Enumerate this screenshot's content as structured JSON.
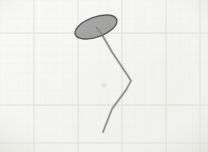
{
  "image": {
    "kind": "scanned-sketch",
    "width": 208,
    "height": 152,
    "title": "Hand sketch on graph paper",
    "description": "Tilted gray filled ellipse with a thin zigzag stem descending below it",
    "background_color": "#f6f6f4",
    "paper_tint_color": "#f2f2ee"
  },
  "grid": {
    "name": "graph-paper-grid",
    "minor_spacing_px": 9,
    "minor_color": "#ecebe6",
    "major_color": "#dcdcd6",
    "major_vertical_x": [
      34,
      78,
      122,
      166,
      200
    ],
    "major_horizontal_y": [
      33,
      105,
      143
    ],
    "minor_opacity": 0.55
  },
  "shapes": {
    "ellipse": {
      "name": "ellipse-cap",
      "center_x": 96,
      "center_y": 27,
      "radius_x": 22,
      "radius_y": 10,
      "rotation_deg": -20,
      "fill_color": "#9b9b9b",
      "stroke_color": "#5a5a5a",
      "stroke_width": 1.4,
      "fill_opacity": 0.92
    },
    "stem": {
      "name": "stem-polyline",
      "points": "101,33 112,52 128,76 131,81 126,90 112,109 103,132",
      "stroke_color": "#7e7e7e",
      "stroke_width": 1.5,
      "stroke_opacity": 0.85
    },
    "stem_highlight": {
      "name": "stem-highlight",
      "points": "101,33 112,52 128,76 131,81 126,90 112,109 103,132",
      "stroke_color": "#b5b5b5",
      "stroke_width": 3,
      "stroke_opacity": 0.35
    },
    "cap_radial_line": {
      "name": "ellipse-radial-crease",
      "x1": 96,
      "y1": 27,
      "x2": 101,
      "y2": 33,
      "stroke_color": "#6e6e6e",
      "stroke_width": 1
    },
    "smudge": {
      "name": "paper-smudge",
      "center_x": 104,
      "center_y": 85,
      "radius": 4,
      "color": "#d8d8d2",
      "opacity": 0.55
    }
  },
  "labels": {
    "alt_text": "Graph paper sketch of a dish-like ellipse on a bent stalk"
  }
}
